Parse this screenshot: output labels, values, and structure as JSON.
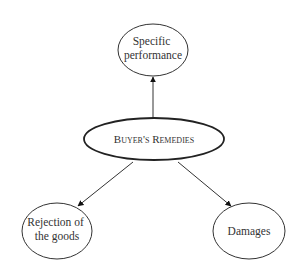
{
  "diagram": {
    "center": {
      "label": "Buyer's Remedies"
    },
    "nodes": [
      {
        "id": "specific-performance",
        "lines": [
          "Specific",
          "performance"
        ]
      },
      {
        "id": "rejection",
        "lines": [
          "Rejection of",
          "the goods"
        ]
      },
      {
        "id": "damages",
        "lines": [
          "Damages"
        ]
      }
    ],
    "colors": {
      "stroke": "#222222",
      "text": "#333333",
      "background": "#ffffff"
    }
  }
}
